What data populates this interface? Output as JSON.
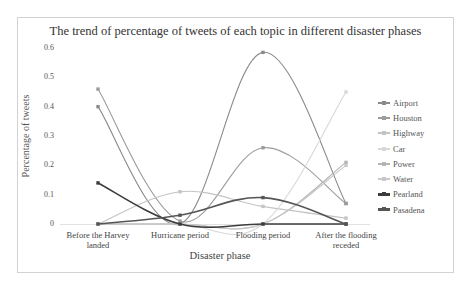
{
  "chart_data": {
    "type": "line",
    "title": "The trend of percentage of tweets of each topic in different disaster phases",
    "xlabel": "Disaster phase",
    "ylabel": "Percentage of tweets",
    "ylim": [
      0,
      0.6
    ],
    "yticks": [
      "0",
      "0.1",
      "0.2",
      "0.3",
      "0.4",
      "0.5",
      "0.6"
    ],
    "categories": [
      "Before the Harvey landed",
      "Hurricane period",
      "Flooding period",
      "After the flooding receded"
    ],
    "category_lines": [
      [
        "Before the Harvey",
        "landed"
      ],
      [
        "Hurricane period"
      ],
      [
        "Flooding period"
      ],
      [
        "After the flooding",
        "receded"
      ]
    ],
    "grid": false,
    "legend_position": "right",
    "smoothed": true,
    "series": [
      {
        "name": "Airport",
        "color": "#8a8a8a",
        "values": [
          0.4,
          0.0,
          0.585,
          0.07
        ]
      },
      {
        "name": "Houston",
        "color": "#9c9c9c",
        "values": [
          0.46,
          0.01,
          0.26,
          0.07
        ]
      },
      {
        "name": "Highway",
        "color": "#c4c4c4",
        "values": [
          0.0,
          0.11,
          0.06,
          0.02
        ]
      },
      {
        "name": "Car",
        "color": "#d8d8d8",
        "values": [
          0.0,
          0.0,
          0.0,
          0.45
        ]
      },
      {
        "name": "Power",
        "color": "#b4b4b4",
        "values": [
          0.0,
          0.0,
          0.0,
          0.21
        ]
      },
      {
        "name": "Water",
        "color": "#c8c8c8",
        "values": [
          0.0,
          0.0,
          0.0,
          0.2
        ]
      },
      {
        "name": "Pearland",
        "color": "#3c3c3c",
        "values": [
          0.14,
          0.0,
          0.0,
          0.0
        ]
      },
      {
        "name": "Pasadena",
        "color": "#555555",
        "values": [
          0.0,
          0.03,
          0.09,
          0.0
        ]
      }
    ]
  }
}
